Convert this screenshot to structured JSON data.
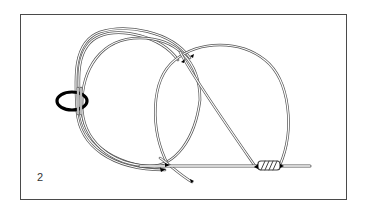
{
  "diagram": {
    "type": "knot-tying-illustration",
    "step_number": "2",
    "elements": [
      "ring",
      "looped line coils",
      "second loop",
      "wrapped turns on standing line",
      "tag end"
    ],
    "colors": {
      "line_outline": "#555555",
      "ring": "#000000",
      "frame": "#4a4a4a",
      "background": "#ffffff"
    }
  }
}
